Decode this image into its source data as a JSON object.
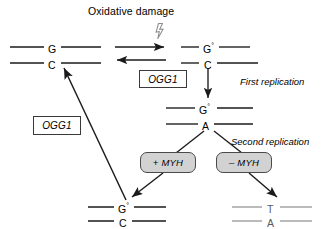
{
  "figure": {
    "title": "Oxidative damage",
    "background_color": "#ffffff",
    "stroke_color": "#1a1a1a",
    "faded_stroke_color": "#9a9a9a",
    "enzyme_fill_color": "#d2d2d2"
  },
  "labels": {
    "oxidative_damage": "Oxidative damage",
    "first_replication": "First replication",
    "second_replication": "Second replication"
  },
  "genes": {
    "ogg1_top": "OGG1",
    "ogg1_left": "OGG1"
  },
  "enzymes": {
    "plus_myh": "+ MYH",
    "minus_myh": "– MYH"
  },
  "duplexes": {
    "undamaged": {
      "name": "undamaged-duplex",
      "top_base": "G",
      "top_superscript": "",
      "bottom_base": "C",
      "bottom_superscript": "",
      "style": "dark"
    },
    "damaged": {
      "name": "damaged-duplex",
      "top_base": "G",
      "top_superscript": "°",
      "bottom_base": "C",
      "bottom_superscript": "",
      "style": "dark"
    },
    "mismatch": {
      "name": "mismatch-duplex",
      "top_base": "G",
      "top_superscript": "°",
      "bottom_base": "A",
      "bottom_superscript": "",
      "style": "dark"
    },
    "repaired": {
      "name": "repaired-duplex",
      "top_base": "G",
      "top_superscript": "°",
      "bottom_base": "C",
      "bottom_superscript": "",
      "style": "dark"
    },
    "mutated": {
      "name": "mutated-duplex",
      "top_base": "T",
      "top_superscript": "",
      "bottom_base": "A",
      "bottom_superscript": "",
      "style": "faded"
    }
  },
  "icons": {
    "lightning_bolt": "lightning-bolt-icon",
    "forward_arrow": "forward-arrow-icon",
    "reverse_arrow": "reverse-arrow-icon",
    "replication_arrow": "replication-arrow-icon",
    "repair_arrow": "repair-arrow-icon"
  }
}
